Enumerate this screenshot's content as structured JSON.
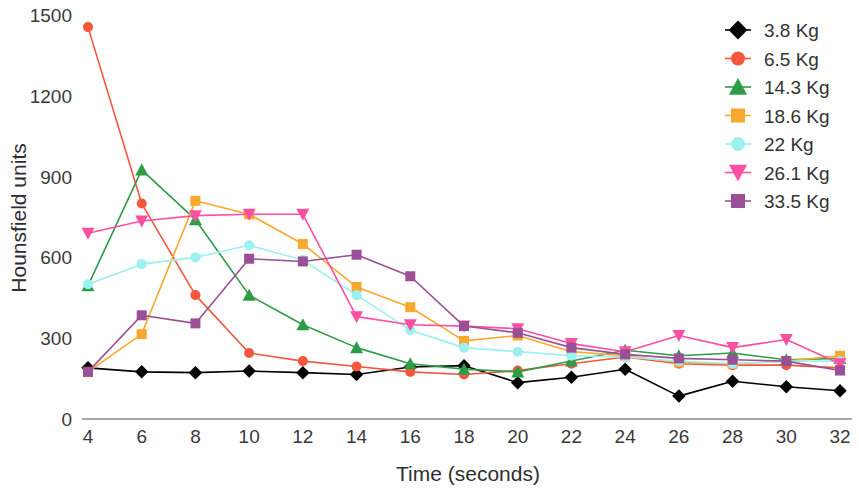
{
  "chart_data": {
    "type": "line",
    "title": "",
    "xlabel": "Time (seconds)",
    "ylabel": "Hounsfield units",
    "x": [
      4,
      6,
      8,
      10,
      12,
      14,
      16,
      18,
      20,
      22,
      24,
      26,
      28,
      30,
      32
    ],
    "xlim": [
      4,
      32
    ],
    "ylim": [
      0,
      1500
    ],
    "xticks": [
      4,
      6,
      8,
      10,
      12,
      14,
      16,
      18,
      20,
      22,
      24,
      26,
      28,
      30,
      32
    ],
    "yticks": [
      0,
      300,
      600,
      900,
      1200,
      1500
    ],
    "grid": false,
    "legend_position": "top-right",
    "series": [
      {
        "name": "3.8 Kg",
        "color": "#000000",
        "marker": "diamond",
        "values": [
          190,
          175,
          172,
          178,
          172,
          165,
          193,
          198,
          135,
          155,
          185,
          85,
          140,
          120,
          105
        ]
      },
      {
        "name": "6.5 Kg",
        "color": "#F4573C",
        "marker": "circle",
        "values": [
          1455,
          800,
          460,
          245,
          215,
          195,
          175,
          165,
          180,
          205,
          230,
          205,
          200,
          200,
          190
        ]
      },
      {
        "name": "14.3 Kg",
        "color": "#2E9B46",
        "marker": "triangle",
        "values": [
          495,
          925,
          740,
          460,
          350,
          265,
          205,
          185,
          175,
          215,
          255,
          235,
          245,
          220,
          225
        ]
      },
      {
        "name": "18.6 Kg",
        "color": "#F9A82E",
        "marker": "square",
        "values": [
          175,
          315,
          810,
          760,
          650,
          490,
          415,
          290,
          310,
          250,
          235,
          210,
          205,
          215,
          235
        ]
      },
      {
        "name": "22 Kg",
        "color": "#9BF0F0",
        "marker": "circle",
        "values": [
          500,
          575,
          600,
          645,
          590,
          460,
          330,
          265,
          250,
          235,
          230,
          215,
          205,
          215,
          215
        ]
      },
      {
        "name": "26.1 Kg",
        "color": "#FF4FA3",
        "marker": "triangle-down",
        "values": [
          690,
          735,
          755,
          760,
          760,
          380,
          350,
          345,
          335,
          280,
          250,
          310,
          265,
          295,
          205
        ]
      },
      {
        "name": "33.5 Kg",
        "color": "#9B4F96",
        "marker": "square",
        "values": [
          175,
          385,
          355,
          595,
          585,
          610,
          530,
          345,
          320,
          265,
          240,
          225,
          220,
          215,
          180
        ]
      }
    ]
  },
  "axes": {
    "y_tick_labels": [
      "1500",
      "1200",
      "900",
      "600",
      "300",
      "0"
    ],
    "x_tick_labels": [
      "4",
      "6",
      "8",
      "10",
      "12",
      "14",
      "16",
      "18",
      "20",
      "22",
      "24",
      "26",
      "28",
      "30",
      "32"
    ],
    "x_axis_title": "Time (seconds)",
    "y_axis_title": "Hounsfield units"
  },
  "legend": {
    "items": [
      {
        "label": "3.8 Kg",
        "color": "#000000",
        "marker": "diamond"
      },
      {
        "label": "6.5 Kg",
        "color": "#F4573C",
        "marker": "circle"
      },
      {
        "label": "14.3 Kg",
        "color": "#2E9B46",
        "marker": "triangle"
      },
      {
        "label": "18.6 Kg",
        "color": "#F9A82E",
        "marker": "square"
      },
      {
        "label": "22 Kg",
        "color": "#9BF0F0",
        "marker": "circle"
      },
      {
        "label": "26.1 Kg",
        "color": "#FF4FA3",
        "marker": "triangle-down"
      },
      {
        "label": "33.5 Kg",
        "color": "#9B4F96",
        "marker": "square"
      }
    ]
  }
}
